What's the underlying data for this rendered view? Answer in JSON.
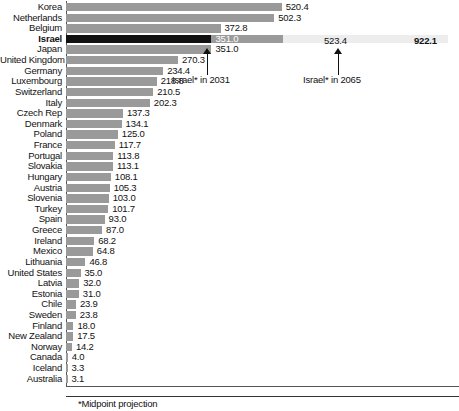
{
  "chart_data": {
    "type": "bar",
    "orientation": "horizontal",
    "title": "",
    "xlabel": "",
    "ylabel": "",
    "xlim": [
      0,
      950
    ],
    "grid": false,
    "legend": null,
    "categories": [
      "Korea",
      "Netherlands",
      "Belgium",
      "Israel",
      "Japan",
      "United Kingdom",
      "Germany",
      "Luxembourg",
      "Switzerland",
      "Italy",
      "Czech Rep",
      "Denmark",
      "Poland",
      "France",
      "Portugal",
      "Slovakia",
      "Hungary",
      "Austria",
      "Slovenia",
      "Turkey",
      "Spain",
      "Greece",
      "Ireland",
      "Mexico",
      "Lithuania",
      "United States",
      "Latvia",
      "Estonia",
      "Chile",
      "Sweden",
      "Finland",
      "New Zealand",
      "Norway",
      "Canada",
      "Iceland",
      "Australia"
    ],
    "values": [
      520.4,
      502.3,
      372.8,
      351.0,
      351.0,
      270.3,
      234.4,
      218.8,
      210.5,
      202.3,
      137.3,
      134.1,
      125.0,
      117.7,
      113.8,
      113.1,
      108.1,
      105.3,
      103.0,
      101.7,
      93.0,
      87.0,
      68.2,
      64.8,
      46.8,
      35.0,
      32.0,
      31.0,
      23.9,
      23.8,
      18.0,
      17.5,
      14.2,
      4.0,
      3.3,
      3.1
    ],
    "highlight_category": "Israel",
    "projections": {
      "current_label": "351.0",
      "mid_value": 523.4,
      "mid_label": "523.4",
      "mid_annotation": "Israel* in 2031",
      "far_value": 922.1,
      "far_label": "922.1",
      "far_annotation": "Israel* in 2065"
    },
    "footnote": "*Midpoint projection"
  },
  "rows": [
    {
      "label": "Korea",
      "value": 520.4,
      "display": "520.4",
      "highlight": false
    },
    {
      "label": "Netherlands",
      "value": 502.3,
      "display": "502.3",
      "highlight": false
    },
    {
      "label": "Belgium",
      "value": 372.8,
      "display": "372.8",
      "highlight": false
    },
    {
      "label": "Israel",
      "value": 351.0,
      "display": "351.0",
      "highlight": true
    },
    {
      "label": "Japan",
      "value": 351.0,
      "display": "351.0",
      "highlight": false
    },
    {
      "label": "United Kingdom",
      "value": 270.3,
      "display": "270.3",
      "highlight": false
    },
    {
      "label": "Germany",
      "value": 234.4,
      "display": "234.4",
      "highlight": false
    },
    {
      "label": "Luxembourg",
      "value": 218.8,
      "display": "218.8",
      "highlight": false
    },
    {
      "label": "Switzerland",
      "value": 210.5,
      "display": "210.5",
      "highlight": false
    },
    {
      "label": "Italy",
      "value": 202.3,
      "display": "202.3",
      "highlight": false
    },
    {
      "label": "Czech Rep",
      "value": 137.3,
      "display": "137.3",
      "highlight": false
    },
    {
      "label": "Denmark",
      "value": 134.1,
      "display": "134.1",
      "highlight": false
    },
    {
      "label": "Poland",
      "value": 125.0,
      "display": "125.0",
      "highlight": false
    },
    {
      "label": "France",
      "value": 117.7,
      "display": "117.7",
      "highlight": false
    },
    {
      "label": "Portugal",
      "value": 113.8,
      "display": "113.8",
      "highlight": false
    },
    {
      "label": "Slovakia",
      "value": 113.1,
      "display": "113.1",
      "highlight": false
    },
    {
      "label": "Hungary",
      "value": 108.1,
      "display": "108.1",
      "highlight": false
    },
    {
      "label": "Austria",
      "value": 105.3,
      "display": "105.3",
      "highlight": false
    },
    {
      "label": "Slovenia",
      "value": 103.0,
      "display": "103.0",
      "highlight": false
    },
    {
      "label": "Turkey",
      "value": 101.7,
      "display": "101.7",
      "highlight": false
    },
    {
      "label": "Spain",
      "value": 93.0,
      "display": "93.0",
      "highlight": false
    },
    {
      "label": "Greece",
      "value": 87.0,
      "display": "87.0",
      "highlight": false
    },
    {
      "label": "Ireland",
      "value": 68.2,
      "display": "68.2",
      "highlight": false
    },
    {
      "label": "Mexico",
      "value": 64.8,
      "display": "64.8",
      "highlight": false
    },
    {
      "label": "Lithuania",
      "value": 46.8,
      "display": "46.8",
      "highlight": false
    },
    {
      "label": "United States",
      "value": 35.0,
      "display": "35.0",
      "highlight": false
    },
    {
      "label": "Latvia",
      "value": 32.0,
      "display": "32.0",
      "highlight": false
    },
    {
      "label": "Estonia",
      "value": 31.0,
      "display": "31.0",
      "highlight": false
    },
    {
      "label": "Chile",
      "value": 23.9,
      "display": "23.9",
      "highlight": false
    },
    {
      "label": "Sweden",
      "value": 23.8,
      "display": "23.8",
      "highlight": false
    },
    {
      "label": "Finland",
      "value": 18.0,
      "display": "18.0",
      "highlight": false
    },
    {
      "label": "New Zealand",
      "value": 17.5,
      "display": "17.5",
      "highlight": false
    },
    {
      "label": "Norway",
      "value": 14.2,
      "display": "14.2",
      "highlight": false
    },
    {
      "label": "Canada",
      "value": 4.0,
      "display": "4.0",
      "highlight": false
    },
    {
      "label": "Iceland",
      "value": 3.3,
      "display": "3.3",
      "highlight": false
    },
    {
      "label": "Australia",
      "value": 3.1,
      "display": "3.1",
      "highlight": false
    }
  ],
  "annotations": {
    "mid_label": "523.4",
    "mid_text": "Israel* in 2031",
    "far_label": "922.1",
    "far_text": "Israel* in 2065",
    "israel_bar_label": "351.0"
  },
  "footnote": {
    "text": "*Midpoint projection"
  },
  "colors": {
    "bar": "#9a9a9a",
    "highlight_bar": "#111111",
    "projection_mid": "#9a9a9a",
    "projection_far": "#ededed",
    "text": "#111111",
    "axis": "#555555"
  }
}
